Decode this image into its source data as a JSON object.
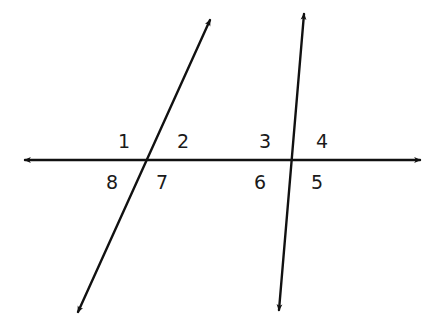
{
  "diagram": {
    "type": "transversal-angles",
    "colors": {
      "line": "#111111",
      "label": "#1a1a1a",
      "background": "#ffffff"
    },
    "lines": [
      {
        "name": "horizontal-line",
        "from": [
          25,
          160
        ],
        "to": [
          420,
          160
        ],
        "arrows": "both"
      },
      {
        "name": "left-transversal",
        "from": [
          210,
          20
        ],
        "to": [
          78,
          312
        ],
        "arrows": "both"
      },
      {
        "name": "right-transversal",
        "from": [
          304,
          14
        ],
        "to": [
          279,
          310
        ],
        "arrows": "both"
      }
    ],
    "intersections": [
      {
        "name": "left-intersection",
        "point": [
          146,
          160
        ]
      },
      {
        "name": "right-intersection",
        "point": [
          292,
          160
        ]
      }
    ],
    "angle_labels": [
      {
        "id": "1",
        "text": "1",
        "x": 124,
        "y": 148
      },
      {
        "id": "2",
        "text": "2",
        "x": 183,
        "y": 148
      },
      {
        "id": "3",
        "text": "3",
        "x": 265,
        "y": 148
      },
      {
        "id": "4",
        "text": "4",
        "x": 322,
        "y": 148
      },
      {
        "id": "5",
        "text": "5",
        "x": 317,
        "y": 189
      },
      {
        "id": "6",
        "text": "6",
        "x": 260,
        "y": 189
      },
      {
        "id": "7",
        "text": "7",
        "x": 162,
        "y": 189
      },
      {
        "id": "8",
        "text": "8",
        "x": 112,
        "y": 189
      }
    ]
  }
}
